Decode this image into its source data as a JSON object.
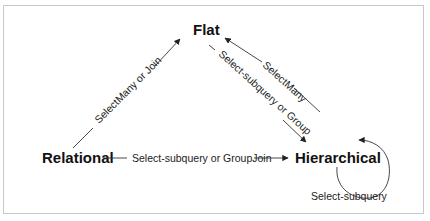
{
  "diagram": {
    "nodes": {
      "flat": "Flat",
      "relational": "Relational",
      "hierarchical": "Hierarchical"
    },
    "edges": {
      "relational_to_flat": "SelectMany or Join",
      "hierarchical_to_flat": "SelectMany",
      "flat_to_hierarchical": "Select-subquery or Group",
      "relational_to_hierarchical": "Select-subquery or GroupJoin",
      "hierarchical_self": "Select-subquery"
    },
    "colors": {
      "border": "#c8c8c8",
      "line": "#333333",
      "text": "#111111"
    }
  }
}
